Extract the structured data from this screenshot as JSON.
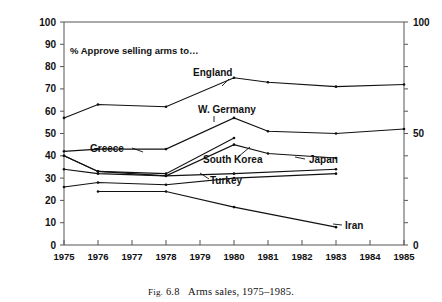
{
  "caption": {
    "prefix": "Fig.",
    "number": "6.8",
    "text": "Arms sales, 1975–1985."
  },
  "annotation": {
    "note": "% Approve selling arms to…"
  },
  "axis": {
    "left_ticks": [
      "0",
      "10",
      "20",
      "30",
      "40",
      "50",
      "60",
      "70",
      "80",
      "90",
      "100"
    ],
    "right_ticks": [
      "0",
      "50",
      "100"
    ],
    "x_ticks": [
      "1975",
      "1976",
      "1977",
      "1978",
      "1979",
      "1980",
      "1981",
      "1982",
      "1983",
      "1984",
      "1985"
    ]
  },
  "labels": {
    "england": "England",
    "w_germany": "W. Germany",
    "south_korea": "South Korea",
    "japan": "Japan",
    "turkey": "Turkey",
    "greece": "Greece",
    "iran": "Iran"
  },
  "chart_data": {
    "type": "line",
    "title": "",
    "annotation": "% Approve selling arms to…",
    "caption": "Fig. 6.8  Arms sales, 1975–1985.",
    "xlabel": "",
    "ylabel": "",
    "xlim": [
      1975,
      1985
    ],
    "ylim": [
      0,
      100
    ],
    "x": [
      1975,
      1976,
      1977,
      1978,
      1979,
      1980,
      1981,
      1982,
      1983,
      1984,
      1985
    ],
    "left_axis_ticks": [
      0,
      10,
      20,
      30,
      40,
      50,
      60,
      70,
      80,
      90,
      100
    ],
    "right_axis_ticks": [
      0,
      50,
      100
    ],
    "grid": false,
    "legend": "inline-labels",
    "marker": "dot",
    "line_color": "#111111",
    "series": [
      {
        "name": "England",
        "points": [
          {
            "x": 1975,
            "y": 57
          },
          {
            "x": 1976,
            "y": 63
          },
          {
            "x": 1978,
            "y": 62
          },
          {
            "x": 1980,
            "y": 75
          },
          {
            "x": 1981,
            "y": 73
          },
          {
            "x": 1983,
            "y": 71
          },
          {
            "x": 1985,
            "y": 72
          }
        ]
      },
      {
        "name": "W. Germany",
        "points": [
          {
            "x": 1975,
            "y": 42
          },
          {
            "x": 1976,
            "y": 43
          },
          {
            "x": 1978,
            "y": 43
          },
          {
            "x": 1980,
            "y": 57
          },
          {
            "x": 1981,
            "y": 51
          },
          {
            "x": 1983,
            "y": 50
          },
          {
            "x": 1985,
            "y": 52
          }
        ]
      },
      {
        "name": "South Korea",
        "points": [
          {
            "x": 1975,
            "y": 40
          },
          {
            "x": 1976,
            "y": 33
          },
          {
            "x": 1978,
            "y": 32
          },
          {
            "x": 1980,
            "y": 48
          }
        ]
      },
      {
        "name": "Japan",
        "points": [
          {
            "x": 1975,
            "y": 40
          },
          {
            "x": 1976,
            "y": 33
          },
          {
            "x": 1978,
            "y": 31
          },
          {
            "x": 1980,
            "y": 45
          },
          {
            "x": 1981,
            "y": 41
          },
          {
            "x": 1983,
            "y": 39
          }
        ]
      },
      {
        "name": "Turkey",
        "points": [
          {
            "x": 1975,
            "y": 34
          },
          {
            "x": 1976,
            "y": 32
          },
          {
            "x": 1978,
            "y": 31
          },
          {
            "x": 1980,
            "y": 32
          },
          {
            "x": 1983,
            "y": 34
          }
        ]
      },
      {
        "name": "Greece",
        "points": [
          {
            "x": 1975,
            "y": 26
          },
          {
            "x": 1976,
            "y": 28
          },
          {
            "x": 1978,
            "y": 27
          },
          {
            "x": 1980,
            "y": 30
          },
          {
            "x": 1983,
            "y": 32
          }
        ]
      },
      {
        "name": "Iran",
        "points": [
          {
            "x": 1976,
            "y": 24
          },
          {
            "x": 1978,
            "y": 24
          },
          {
            "x": 1980,
            "y": 17
          },
          {
            "x": 1983,
            "y": 8
          }
        ]
      }
    ]
  }
}
